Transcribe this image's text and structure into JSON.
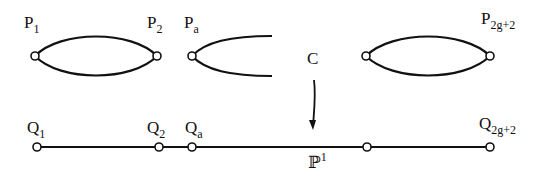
{
  "diagram": {
    "top_curve_label": "C",
    "bottom_line_label": "ℙ",
    "bottom_line_label_sup": "1",
    "top_points": [
      {
        "base": "P",
        "sub": "1"
      },
      {
        "base": "P",
        "sub": "2"
      },
      {
        "base": "P",
        "sub": "a"
      },
      {
        "base": "P",
        "sub": "2g+2"
      }
    ],
    "bottom_points": [
      {
        "base": "Q",
        "sub": "1"
      },
      {
        "base": "Q",
        "sub": "2"
      },
      {
        "base": "Q",
        "sub": "a"
      },
      {
        "base": "Q",
        "sub": "2g+2"
      }
    ],
    "arrow": "covering map C → ℙ¹"
  }
}
